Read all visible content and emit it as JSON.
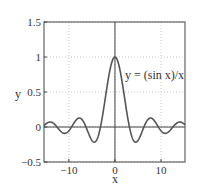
{
  "chart_data": {
    "type": "line",
    "title": "",
    "xlabel": "x",
    "ylabel": "y",
    "xlim": [
      -15.4,
      15.2
    ],
    "ylim": [
      -0.5,
      1.5
    ],
    "grid": true,
    "legend": null,
    "x_ticks": [
      -10,
      0,
      10
    ],
    "x_tick_labels": [
      "−10",
      "0",
      "10"
    ],
    "y_ticks": [
      -0.5,
      0,
      0.5,
      1,
      1.5
    ],
    "y_tick_labels": [
      "−0.5",
      "0",
      "0.5",
      "1",
      "1.5"
    ],
    "annotations": [
      {
        "text": "y = (sin x)/x",
        "x": 2,
        "y": 0.75
      }
    ],
    "series": [
      {
        "name": "y = (sin x)/x",
        "function": "sin(x)/x",
        "x": [
          -15,
          -12.5,
          -10.9,
          -9.4,
          -7.7,
          -6.3,
          -4.5,
          -3.14,
          -2,
          -1,
          0,
          1,
          2,
          3.14,
          4.5,
          6.3,
          7.7,
          9.4,
          10.9,
          12.5,
          15
        ],
        "values": [
          0.043,
          -0.005,
          -0.091,
          0.0,
          0.128,
          0.0,
          -0.217,
          0.0,
          0.455,
          0.841,
          1.0,
          0.841,
          0.455,
          0.0,
          -0.217,
          0.0,
          0.128,
          0.0,
          -0.091,
          -0.005,
          0.043
        ]
      }
    ],
    "reference_lines": [
      {
        "type": "horizontal",
        "y": 0
      },
      {
        "type": "vertical",
        "x": 0
      }
    ]
  }
}
